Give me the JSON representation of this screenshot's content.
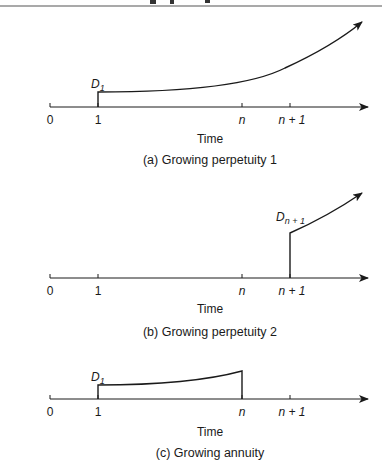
{
  "header": {
    "text_cut_off": true
  },
  "panels": [
    {
      "id": "a",
      "caption": "(a)  Growing perpetuity 1",
      "xlabel": "Time",
      "ticks": [
        "0",
        "1",
        "n",
        "n + 1"
      ],
      "dividend_label": {
        "base": "D",
        "sub": "1"
      },
      "description": "Cash flows start at time 1 and grow forever"
    },
    {
      "id": "b",
      "caption": "(b)  Growing perpetuity 2",
      "xlabel": "Time",
      "ticks": [
        "0",
        "1",
        "n",
        "n + 1"
      ],
      "dividend_label": {
        "base": "D",
        "sub": "n + 1"
      },
      "description": "Cash flows start at time n + 1 and grow forever"
    },
    {
      "id": "c",
      "caption": "(c)  Growing annuity",
      "xlabel": "Time",
      "ticks": [
        "0",
        "1",
        "n",
        "n + 1"
      ],
      "dividend_label": {
        "base": "D",
        "sub": "1"
      },
      "description": "Cash flows start at time 1, grow, and stop at time n"
    }
  ],
  "colors": {
    "line": "#1a1a1a",
    "background": "#ffffff",
    "rule": "#555555"
  }
}
